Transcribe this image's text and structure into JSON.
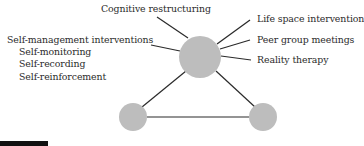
{
  "diagram": {
    "center_node_color": "#bdbdbd",
    "node_color": "#bdbdbd",
    "line_color": "#2a2a2a",
    "top_label": "Cognitive restructuring",
    "left_group": {
      "heading": "Self-management interventions",
      "items": [
        "Self-monitoring",
        "Self-recording",
        "Self-reinforcement"
      ]
    },
    "right_labels": [
      "Life space intervention",
      "Peer group meetings",
      "Reality therapy"
    ]
  }
}
